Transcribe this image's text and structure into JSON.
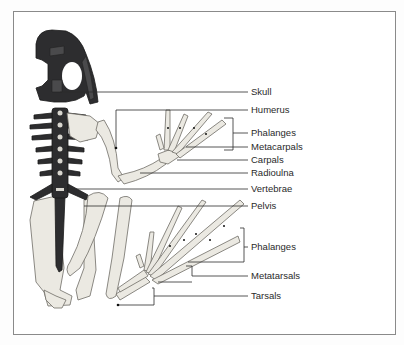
{
  "diagram": {
    "labels": [
      {
        "id": "skull",
        "text": "Skull",
        "x": 251,
        "y": 93
      },
      {
        "id": "humerus",
        "text": "Humerus",
        "x": 251,
        "y": 113
      },
      {
        "id": "phalanges-fore",
        "text": "Phalanges",
        "x": 251,
        "y": 133
      },
      {
        "id": "metacarpals",
        "text": "Metacarpals",
        "x": 251,
        "y": 152
      },
      {
        "id": "carpals",
        "text": "Carpals",
        "x": 251,
        "y": 164
      },
      {
        "id": "radioulna",
        "text": "Radioulna",
        "x": 251,
        "y": 177
      },
      {
        "id": "vertebrae",
        "text": "Vertebrae",
        "x": 251,
        "y": 191
      },
      {
        "id": "pelvis",
        "text": "Pelvis",
        "x": 251,
        "y": 211
      },
      {
        "id": "phalanges-hind",
        "text": "Phalanges",
        "x": 251,
        "y": 249
      },
      {
        "id": "metatarsals",
        "text": "Metatarsals",
        "x": 251,
        "y": 276
      },
      {
        "id": "tarsals",
        "text": "Tarsals",
        "x": 251,
        "y": 297
      }
    ]
  }
}
